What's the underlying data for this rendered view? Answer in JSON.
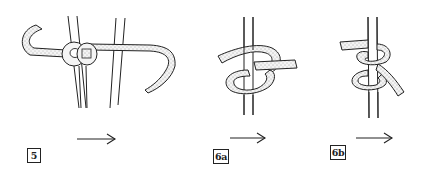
{
  "figure": {
    "steps": [
      {
        "id": "5",
        "label": "5",
        "description": "Rope wrapped around two vertical poles, starting loop"
      },
      {
        "id": "6a",
        "label": "6a",
        "description": "Rope looped around vertical pole forming an overhand turn"
      },
      {
        "id": "6b",
        "label": "6b",
        "description": "Rope tied around vertical pole with two crossing turns"
      }
    ],
    "arrows": [
      {
        "from": "5",
        "direction": "right"
      },
      {
        "from": "6a",
        "direction": "right"
      },
      {
        "from": "6b",
        "direction": "right"
      }
    ],
    "colors": {
      "line": "#222222",
      "rope_fill": "#f2f2f2",
      "stipple": "#555555",
      "background": "#ffffff"
    }
  }
}
